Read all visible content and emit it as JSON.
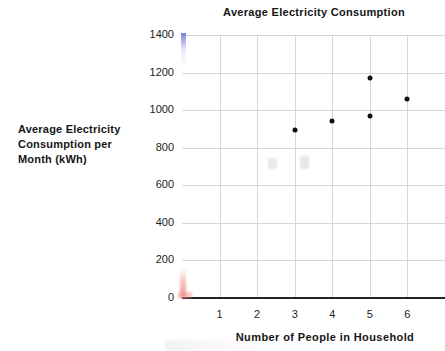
{
  "chart_data": {
    "type": "scatter",
    "title": "Average Electricity Consumption",
    "xlabel": "Number of People in Household",
    "ylabel": "Average Electricity Consumption per Month (kWh)",
    "ylabel_lines": [
      "Average Electricity",
      "Consumption per",
      "Month (kWh)"
    ],
    "x": [
      3,
      4,
      5,
      5,
      6
    ],
    "values": [
      895,
      940,
      970,
      1170,
      1060
    ],
    "points": [
      {
        "x": 3,
        "y": 895
      },
      {
        "x": 4,
        "y": 940
      },
      {
        "x": 5,
        "y": 970
      },
      {
        "x": 5,
        "y": 1170
      },
      {
        "x": 6,
        "y": 1060
      }
    ],
    "xlim": [
      0,
      7
    ],
    "ylim": [
      0,
      1400
    ],
    "x_ticks": [
      "1",
      "2",
      "3",
      "4",
      "5",
      "6"
    ],
    "x_tick_values": [
      1,
      2,
      3,
      4,
      5,
      6
    ],
    "y_ticks": [
      "0",
      "200",
      "400",
      "600",
      "800",
      "1000",
      "1200",
      "1400"
    ],
    "y_tick_values": [
      0,
      200,
      400,
      600,
      800,
      1000,
      1200,
      1400
    ],
    "grid": true,
    "legend": false,
    "marker_color": "#101010",
    "gridline_color": "#d6d6d6",
    "axis_color": "#232323"
  }
}
